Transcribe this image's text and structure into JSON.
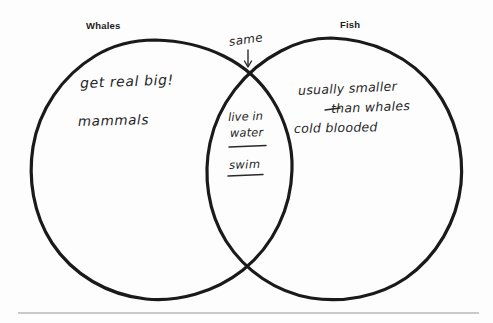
{
  "diagram": {
    "type": "venn",
    "title_left": "Whales",
    "title_right": "Fish",
    "background_color": "#fdfdfd",
    "stroke_color": "#1a1a1a",
    "ink_color": "#262626",
    "rule_color": "#b9b9b9"
  },
  "labels": {
    "left_set": "Whales",
    "right_set": "Fish"
  },
  "left_only": {
    "items": [
      "get real big!",
      "mammals"
    ]
  },
  "right_only": {
    "items": [
      "usually smaller",
      "than whales",
      "cold blooded"
    ]
  },
  "intersection": {
    "items": [
      "live in",
      "water",
      "swim"
    ]
  },
  "annotation": {
    "text": "same",
    "arrow": "down-arrow-icon"
  }
}
